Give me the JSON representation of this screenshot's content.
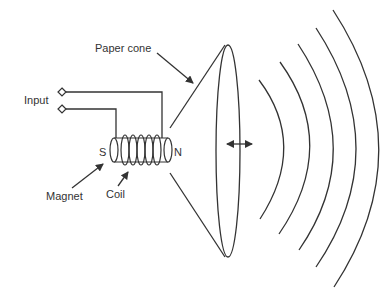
{
  "diagram": {
    "labels": {
      "paper_cone": "Paper cone",
      "input": "Input",
      "magnet": "Magnet",
      "coil": "Coil",
      "south_pole": "S",
      "north_pole": "N"
    },
    "colors": {
      "stroke": "#333333",
      "background": "#ffffff"
    },
    "sound_wave_count": 5
  }
}
